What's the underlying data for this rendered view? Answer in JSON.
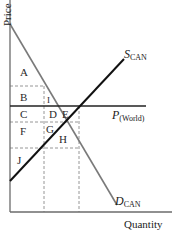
{
  "diagram": {
    "type": "supply-demand-world-price",
    "axes": {
      "y_label": "Price",
      "x_label": "Quantity"
    },
    "curves": {
      "supply": {
        "symbol": "S",
        "subscript": "CAN",
        "color": "#111111"
      },
      "demand": {
        "symbol": "D",
        "subscript": "CAN",
        "color": "#7a7a7a"
      },
      "world_price": {
        "symbol": "P",
        "subscript": "(World)",
        "color": "#222222"
      }
    },
    "regions": [
      "A",
      "B",
      "C",
      "D",
      "E",
      "F",
      "G",
      "H",
      "I",
      "J"
    ],
    "colors": {
      "axis": "#6b6b6b",
      "dashed": "#8a8a8a",
      "text": "#2a2a2a"
    }
  }
}
